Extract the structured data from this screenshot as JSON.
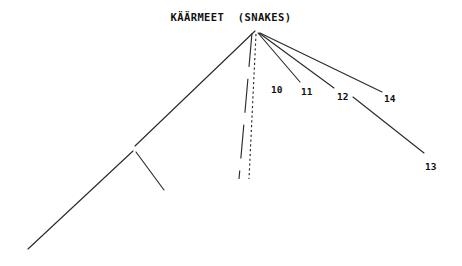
{
  "diagram": {
    "title": "KÄÄRMEET  (SNAKES)",
    "type": "cladogram",
    "background_color": "#ffffff",
    "line_color": "#2b2b2b",
    "text_color": "#111111",
    "apex": {
      "x": 255,
      "y": 31
    },
    "labels": [
      {
        "id": "10",
        "text": "10",
        "x": 271,
        "y": 84
      },
      {
        "id": "11",
        "text": "11",
        "x": 301,
        "y": 86
      },
      {
        "id": "12",
        "text": "12",
        "x": 337,
        "y": 91
      },
      {
        "id": "13",
        "text": "13",
        "x": 425,
        "y": 161
      },
      {
        "id": "14",
        "text": "14",
        "x": 384,
        "y": 93
      }
    ],
    "branches": [
      {
        "name": "left-main-branch",
        "style": "solid",
        "points": "255,31 135,146"
      },
      {
        "name": "left-fork-left-arm",
        "style": "solid",
        "points": "133,151 28,249"
      },
      {
        "name": "left-fork-right-arm",
        "style": "solid",
        "points": "136,152 164,190"
      },
      {
        "name": "branch-dashed-unlabeled",
        "style": "dashed",
        "points": "252,33 239,179"
      },
      {
        "name": "branch-10",
        "style": "dotted",
        "points": "256,34 249,179"
      },
      {
        "name": "branch-11",
        "style": "solid",
        "points": "258,33 300,82"
      },
      {
        "name": "branch-12",
        "style": "solid",
        "points": "259,33 334,88"
      },
      {
        "name": "branch-13",
        "style": "solid",
        "points": "353,97 424,153"
      },
      {
        "name": "branch-14",
        "style": "solid",
        "points": "260,33 382,92"
      }
    ]
  }
}
